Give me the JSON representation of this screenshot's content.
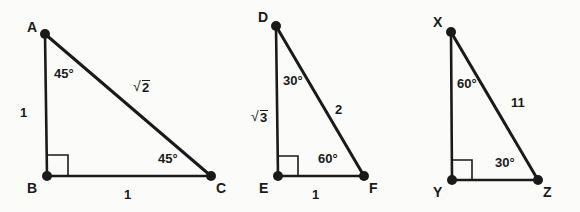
{
  "figure": {
    "background_color": "#fbfbfa",
    "stroke_color": "#1a1a1a",
    "text_color": "#1a1a1a"
  },
  "triangles": [
    {
      "id": "triangle-abc",
      "type": "45-45-90",
      "vertices": [
        {
          "name": "A",
          "label": "A",
          "x": 45,
          "y": 34
        },
        {
          "name": "B",
          "label": "B",
          "x": 47,
          "y": 176
        },
        {
          "name": "C",
          "label": "C",
          "x": 211,
          "y": 176
        }
      ],
      "right_angle_at": "B",
      "angles": [
        {
          "at": "A",
          "label": "45°"
        },
        {
          "at": "C",
          "label": "45°"
        }
      ],
      "sides": [
        {
          "name": "leg-vertical",
          "from": "A",
          "to": "B",
          "label": "1"
        },
        {
          "name": "leg-horizontal",
          "from": "B",
          "to": "C",
          "label": "1"
        },
        {
          "name": "hypotenuse",
          "from": "A",
          "to": "C",
          "label": "√2",
          "radicand": "2"
        }
      ]
    },
    {
      "id": "triangle-def",
      "type": "30-60-90",
      "vertices": [
        {
          "name": "D",
          "label": "D",
          "x": 276,
          "y": 26
        },
        {
          "name": "E",
          "label": "E",
          "x": 278,
          "y": 176
        },
        {
          "name": "F",
          "label": "F",
          "x": 364,
          "y": 176
        }
      ],
      "right_angle_at": "E",
      "angles": [
        {
          "at": "D",
          "label": "30°"
        },
        {
          "at": "F",
          "label": "60°"
        }
      ],
      "sides": [
        {
          "name": "leg-vertical",
          "from": "D",
          "to": "E",
          "label": "√3",
          "radicand": "3"
        },
        {
          "name": "leg-horizontal",
          "from": "E",
          "to": "F",
          "label": "1"
        },
        {
          "name": "hypotenuse",
          "from": "D",
          "to": "F",
          "label": "2"
        }
      ]
    },
    {
      "id": "triangle-xyz",
      "type": "30-60-90",
      "vertices": [
        {
          "name": "X",
          "label": "X",
          "x": 451,
          "y": 32
        },
        {
          "name": "Y",
          "label": "Y",
          "x": 452,
          "y": 180
        },
        {
          "name": "Z",
          "label": "Z",
          "x": 538,
          "y": 180
        }
      ],
      "right_angle_at": "Y",
      "angles": [
        {
          "at": "X",
          "label": "60°"
        },
        {
          "at": "Z",
          "label": "30°"
        }
      ],
      "sides": [
        {
          "name": "leg-vertical",
          "from": "X",
          "to": "Y",
          "label": ""
        },
        {
          "name": "leg-horizontal",
          "from": "Y",
          "to": "Z",
          "label": ""
        },
        {
          "name": "hypotenuse",
          "from": "X",
          "to": "Z",
          "label": "11"
        }
      ]
    }
  ],
  "labels": {
    "t1": {
      "vertex_a": "A",
      "vertex_b": "B",
      "vertex_c": "C",
      "angle_a": "45°",
      "angle_c": "45°",
      "leg_vertical": "1",
      "leg_base": "1",
      "hyp_radicand": "2"
    },
    "t2": {
      "vertex_d": "D",
      "vertex_e": "E",
      "vertex_f": "F",
      "angle_d": "30°",
      "angle_f": "60°",
      "leg_vertical_radicand": "3",
      "leg_base": "1",
      "hyp": "2"
    },
    "t3": {
      "vertex_x": "X",
      "vertex_y": "Y",
      "vertex_z": "Z",
      "angle_x": "60°",
      "angle_z": "30°",
      "hyp": "11"
    },
    "radical_sign": "√"
  }
}
